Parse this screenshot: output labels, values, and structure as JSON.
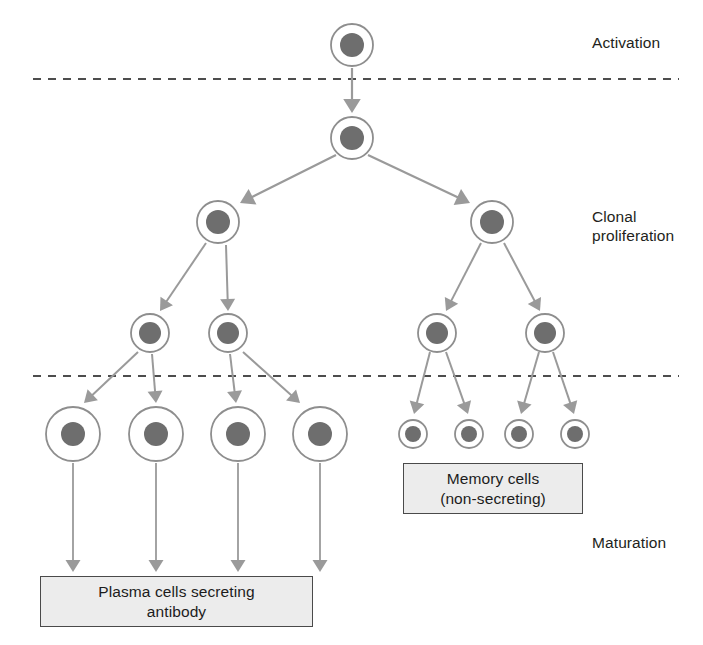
{
  "figure": {
    "background_color": "#ffffff",
    "cell_ring_color": "#8e8e8e",
    "cell_nucleus_color": "#6e6e6e",
    "arrow_color": "#9a9a9a",
    "plasma_arrow_color": "#9a9a9a",
    "divider_color": "#4d4d4d",
    "box_fill_color": "#ececec",
    "box_border_color": "#4a4a4a",
    "text_color": "#231f20"
  },
  "stage_labels": [
    {
      "id": "activation",
      "text": "Activation",
      "x": 592,
      "y": 33
    },
    {
      "id": "clonal-proliferation",
      "text": "Clonal\nproliferation",
      "x": 592,
      "y": 207
    },
    {
      "id": "maturation",
      "text": "Maturation",
      "x": 592,
      "y": 533
    }
  ],
  "dividers": [
    {
      "id": "activation-divider",
      "y": 79,
      "x1": 33,
      "x2": 679
    },
    {
      "id": "maturation-divider",
      "y": 376,
      "x1": 33,
      "x2": 679
    }
  ],
  "cells": [
    {
      "id": "activated-b-cell",
      "group": "stem",
      "cx": 352,
      "cy": 45,
      "r": 21,
      "nr": 12
    },
    {
      "id": "dividing-b-cell",
      "group": "stem",
      "cx": 352,
      "cy": 138,
      "r": 21,
      "nr": 12
    },
    {
      "id": "clone-left",
      "group": "clone",
      "cx": 218,
      "cy": 222,
      "r": 21,
      "nr": 12
    },
    {
      "id": "clone-right",
      "group": "clone",
      "cx": 492,
      "cy": 222,
      "r": 21,
      "nr": 12
    },
    {
      "id": "clone-left-a",
      "group": "clone2",
      "cx": 150,
      "cy": 333,
      "r": 19,
      "nr": 11
    },
    {
      "id": "clone-left-b",
      "group": "clone2",
      "cx": 228,
      "cy": 333,
      "r": 19,
      "nr": 11
    },
    {
      "id": "clone-right-a",
      "group": "clone2",
      "cx": 437,
      "cy": 333,
      "r": 19,
      "nr": 11
    },
    {
      "id": "clone-right-b",
      "group": "clone2",
      "cx": 545,
      "cy": 333,
      "r": 19,
      "nr": 11
    },
    {
      "id": "plasma-cell-1",
      "group": "plasma",
      "cx": 73,
      "cy": 434,
      "r": 27,
      "nr": 12
    },
    {
      "id": "plasma-cell-2",
      "group": "plasma",
      "cx": 156,
      "cy": 434,
      "r": 27,
      "nr": 12
    },
    {
      "id": "plasma-cell-3",
      "group": "plasma",
      "cx": 238,
      "cy": 434,
      "r": 27,
      "nr": 12
    },
    {
      "id": "plasma-cell-4",
      "group": "plasma",
      "cx": 320,
      "cy": 434,
      "r": 27,
      "nr": 12
    },
    {
      "id": "memory-cell-1",
      "group": "memory",
      "cx": 413,
      "cy": 434,
      "r": 14,
      "nr": 8
    },
    {
      "id": "memory-cell-2",
      "group": "memory",
      "cx": 469,
      "cy": 434,
      "r": 14,
      "nr": 8
    },
    {
      "id": "memory-cell-3",
      "group": "memory",
      "cx": 519,
      "cy": 434,
      "r": 14,
      "nr": 8
    },
    {
      "id": "memory-cell-4",
      "group": "memory",
      "cx": 575,
      "cy": 434,
      "r": 14,
      "nr": 8
    }
  ],
  "arrows": [
    {
      "id": "arrow-activation",
      "x1": 352,
      "y1": 68,
      "x2": 352,
      "y2": 113,
      "w": 2.2,
      "head": 7
    },
    {
      "id": "arrow-split-left",
      "x1": 336,
      "y1": 155,
      "x2": 240,
      "y2": 203,
      "w": 2.2,
      "head": 7
    },
    {
      "id": "arrow-split-right",
      "x1": 368,
      "y1": 155,
      "x2": 470,
      "y2": 203,
      "w": 2.2,
      "head": 7
    },
    {
      "id": "arrow-left-to-a",
      "x1": 206,
      "y1": 243,
      "x2": 160,
      "y2": 311,
      "w": 2.0,
      "head": 6
    },
    {
      "id": "arrow-left-to-b",
      "x1": 226,
      "y1": 245,
      "x2": 228,
      "y2": 311,
      "w": 2.0,
      "head": 6
    },
    {
      "id": "arrow-right-to-a",
      "x1": 481,
      "y1": 243,
      "x2": 446,
      "y2": 311,
      "w": 2.0,
      "head": 6
    },
    {
      "id": "arrow-right-to-b",
      "x1": 504,
      "y1": 243,
      "x2": 540,
      "y2": 311,
      "w": 2.0,
      "head": 6
    },
    {
      "id": "arrow-la-to-plasma1",
      "x1": 138,
      "y1": 352,
      "x2": 84,
      "y2": 403,
      "w": 2.0,
      "head": 6
    },
    {
      "id": "arrow-la-to-plasma2",
      "x1": 152,
      "y1": 354,
      "x2": 156,
      "y2": 403,
      "w": 2.0,
      "head": 6
    },
    {
      "id": "arrow-lb-to-plasma3",
      "x1": 230,
      "y1": 354,
      "x2": 236,
      "y2": 403,
      "w": 2.0,
      "head": 6
    },
    {
      "id": "arrow-lb-to-plasma4",
      "x1": 243,
      "y1": 352,
      "x2": 300,
      "y2": 403,
      "w": 2.0,
      "head": 6
    },
    {
      "id": "arrow-ra-to-memory1",
      "x1": 430,
      "y1": 352,
      "x2": 414,
      "y2": 414,
      "w": 2.0,
      "head": 6
    },
    {
      "id": "arrow-ra-to-memory2",
      "x1": 446,
      "y1": 352,
      "x2": 468,
      "y2": 414,
      "w": 2.0,
      "head": 6
    },
    {
      "id": "arrow-rb-to-memory3",
      "x1": 539,
      "y1": 352,
      "x2": 521,
      "y2": 414,
      "w": 2.0,
      "head": 6
    },
    {
      "id": "arrow-rb-to-memory4",
      "x1": 553,
      "y1": 352,
      "x2": 574,
      "y2": 414,
      "w": 2.0,
      "head": 6
    },
    {
      "id": "arrow-plasma1-to-box",
      "x1": 73,
      "y1": 463,
      "x2": 73,
      "y2": 572,
      "w": 1.8,
      "head": 6
    },
    {
      "id": "arrow-plasma2-to-box",
      "x1": 156,
      "y1": 463,
      "x2": 156,
      "y2": 572,
      "w": 1.8,
      "head": 6
    },
    {
      "id": "arrow-plasma3-to-box",
      "x1": 238,
      "y1": 463,
      "x2": 238,
      "y2": 572,
      "w": 1.8,
      "head": 6
    },
    {
      "id": "arrow-plasma4-to-box",
      "x1": 320,
      "y1": 463,
      "x2": 320,
      "y2": 572,
      "w": 1.8,
      "head": 6
    }
  ],
  "boxes": [
    {
      "id": "memory-cells-box",
      "text": "Memory cells\n(non-secreting)",
      "x": 403,
      "y": 463,
      "w": 180,
      "h": 51
    },
    {
      "id": "plasma-cells-box",
      "text": "Plasma cells secreting\nantibody",
      "x": 40,
      "y": 576,
      "w": 273,
      "h": 51
    }
  ]
}
